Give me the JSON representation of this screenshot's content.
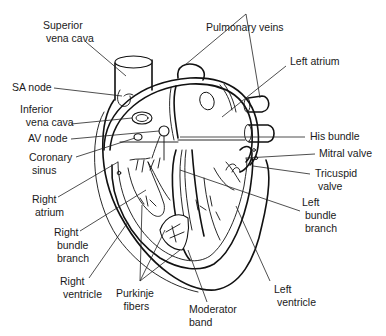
{
  "labels": {
    "superior_vena_cava": "Superior\n vena cava",
    "sa_node": "SA node",
    "inferior_vena_cava": "Inferior\n  vena cava",
    "av_node": "AV node",
    "coronary_sinus": "Coronary\n sinus",
    "right_atrium": "Right\n atrium",
    "right_bundle_branch": "Right\n bundle\n branch",
    "right_ventricle": "Right\n ventricle",
    "purkinje_fibers": "Purkinje\n fibers",
    "moderator_band": "Moderator\nband",
    "pulmonary_veins": "Pulmonary veins",
    "left_atrium": "Left atrium",
    "his_bundle": "His bundle",
    "mitral_valve": "Mitral valve",
    "tricuspid_valve": "Tricuspid\n valve",
    "left_bundle_branch": "Left\n bundle\n branch",
    "left_ventricle": "Left\n ventricle"
  },
  "colors": {
    "line": "#111111",
    "text": "#1a1a1a",
    "background": "#ffffff"
  }
}
